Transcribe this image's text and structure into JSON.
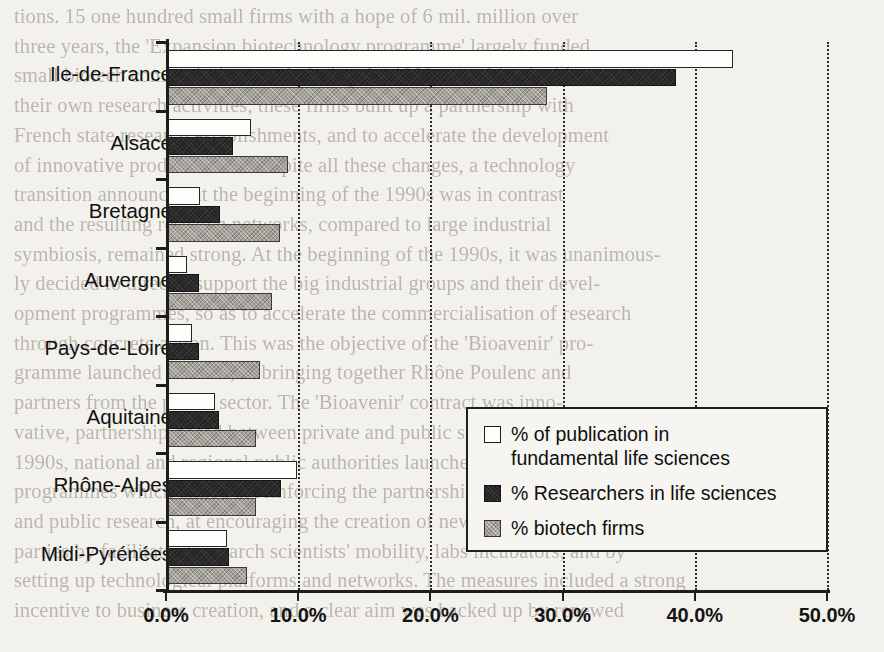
{
  "chart_data": {
    "type": "bar",
    "orientation": "horizontal",
    "title": "",
    "xlabel": "",
    "ylabel": "",
    "xlim": [
      0,
      50
    ],
    "xticks": [
      "0.0%",
      "10.0%",
      "20.0%",
      "30.0%",
      "40.0%",
      "50.0%"
    ],
    "xtick_values": [
      0,
      10,
      20,
      30,
      40,
      50
    ],
    "grid": "vertical dotted gridlines at each x tick",
    "legend_position": "inside lower-right of plot area",
    "categories": [
      "Ile-de-France",
      "Alsace",
      "Bretagne",
      "Auvergne",
      "Pays-de-Loire",
      "Aquitaine",
      "Rhône-Alpes",
      "Midi-Pyrénées"
    ],
    "series": [
      {
        "name": "% of publication in\nfundamental life sciences",
        "color": "#fdfdfb",
        "values": [
          42.9,
          6.4,
          2.6,
          1.6,
          2.0,
          3.7,
          9.9,
          4.6
        ]
      },
      {
        "name": "% Researchers in life sciences",
        "color": "#232323",
        "values": [
          38.6,
          5.1,
          4.1,
          2.5,
          2.5,
          4.0,
          8.7,
          4.8
        ]
      },
      {
        "name": "% biotech firms",
        "color": "#a6a29a",
        "values": [
          28.8,
          9.2,
          8.6,
          8.0,
          7.1,
          6.8,
          6.8,
          6.1
        ]
      }
    ]
  },
  "legend": {
    "items": [
      "% of publication in\nfundamental life sciences",
      "% Researchers in life sciences",
      "% biotech firms"
    ]
  },
  "background_text": {
    "lines": [
      "tions. 15 one hundred small firms with a hope of 6 mil. million over",
      "three years, the 'Expansion biotechnology programme' largely funded",
      "small biotech companies' research during the 1980s, combined with",
      "their own research activities, these firms built up a partnership with",
      "French state research establishments, and to accelerate the development",
      "of innovative products. That despite all these changes, a technology",
      "transition announced at the beginning of the 1990s was in contrast",
      "and the resulting research networks, compared to large industrial",
      "symbiosis, remained strong. At the beginning of the 1990s, it was unanimous-",
      "ly decided to directly support the big industrial groups and their devel-",
      "opment programmes, so as to accelerate the commercialisation of research",
      "through concrete action. This was the objective of the 'Bioavenir' pro-",
      "gramme launched in 1991, in bringing together Rhône Poulenc and",
      "partners from the public sector. The 'Bioavenir' contract was inno-",
      "vative, partnership-based between private and public sectors. In the mid-",
      "1990s, national and regional public authorities launched a series of",
      "programmes which aimed at reinforcing the partnerships between private",
      "and public research, at encouraging the creation of new firms, notably",
      "parties by facilitating research scientists' mobility, labs incubators, and by",
      "setting up technological platforms and networks. The measures included a strong",
      "incentive to business creation, and a clear aim was backed up by renewed"
    ]
  }
}
